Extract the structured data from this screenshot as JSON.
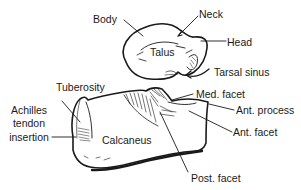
{
  "figure": {
    "type": "anatomical-line-drawing",
    "bones": {
      "talus": "Talus",
      "calcaneus": "Calcaneus"
    },
    "labels": {
      "body": "Body",
      "neck": "Neck",
      "head": "Head",
      "tarsal_sinus": "Tarsal sinus",
      "tuberosity": "Tuberosity",
      "achilles_1": "Achilles",
      "achilles_2": "tendon",
      "achilles_3": "insertion",
      "med_facet": "Med. facet",
      "ant_process": "Ant. process",
      "ant_facet": "Ant. facet",
      "post_facet": "Post. facet"
    },
    "colors": {
      "ink": "#1a1a1a",
      "background": "#ffffff"
    }
  }
}
